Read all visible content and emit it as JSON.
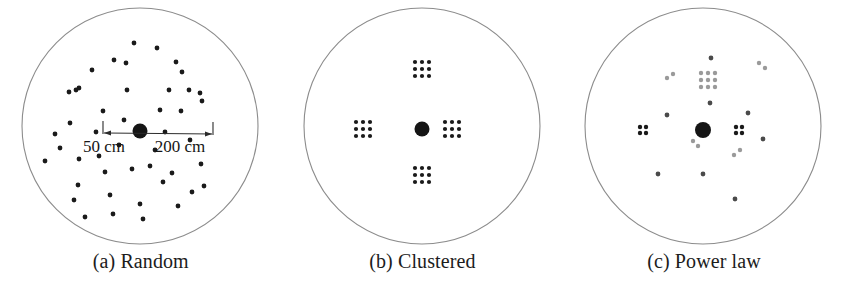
{
  "figure": {
    "type": "spatial-point-distribution-diagram",
    "panel_count": 3,
    "background_color": "#ffffff",
    "boundary_circle_color": "#8c8c8c",
    "dot_color": "#1a1a1a",
    "faint_dot_color": "#9a9a9a"
  },
  "annotation": {
    "inner_label": "50 cm",
    "outer_label": "200 cm",
    "line_color": "#2b2b2b",
    "font_size_px": 17
  },
  "panels": [
    {
      "id": "a",
      "caption": "(a) Random",
      "boundary": {
        "cx": 140,
        "cy": 126,
        "r": 118
      },
      "hub": {
        "cx": 140,
        "cy": 131,
        "r": 7.5
      },
      "has_scale_annotation": true,
      "point_count": 46,
      "points": [
        [
          134,
          43
        ],
        [
          157,
          48
        ],
        [
          114,
          60
        ],
        [
          126,
          63
        ],
        [
          92,
          70
        ],
        [
          176,
          62
        ],
        [
          182,
          72
        ],
        [
          76,
          90
        ],
        [
          79,
          88
        ],
        [
          69,
          92
        ],
        [
          127,
          90
        ],
        [
          169,
          90
        ],
        [
          189,
          90
        ],
        [
          200,
          93
        ],
        [
          202,
          101
        ],
        [
          103,
          111
        ],
        [
          160,
          110
        ],
        [
          181,
          111
        ],
        [
          70,
          123
        ],
        [
          55,
          134
        ],
        [
          99,
          156
        ],
        [
          79,
          159
        ],
        [
          45,
          161
        ],
        [
          78,
          185
        ],
        [
          105,
          172
        ],
        [
          132,
          169
        ],
        [
          150,
          166
        ],
        [
          172,
          173
        ],
        [
          201,
          164
        ],
        [
          163,
          182
        ],
        [
          204,
          186
        ],
        [
          74,
          200
        ],
        [
          110,
          195
        ],
        [
          140,
          204
        ],
        [
          192,
          192
        ],
        [
          113,
          214
        ],
        [
          178,
          206
        ],
        [
          143,
          219
        ],
        [
          85,
          217
        ],
        [
          155,
          150
        ],
        [
          119,
          145
        ],
        [
          190,
          140
        ],
        [
          60,
          148
        ],
        [
          165,
          132
        ],
        [
          96,
          132
        ],
        [
          124,
          120
        ]
      ]
    },
    {
      "id": "b",
      "caption": "(b) Clustered",
      "boundary": {
        "cx": 140,
        "cy": 126,
        "r": 118
      },
      "hub": {
        "cx": 140,
        "cy": 129,
        "r": 7.5
      },
      "has_scale_annotation": false,
      "cluster_layout": "3x3-grid",
      "cluster_dot_count": 9,
      "cluster_spacing_px": 7,
      "cluster_dot_radius_px": 2.1,
      "clusters": [
        {
          "cx": 140,
          "cy": 69,
          "position": "top"
        },
        {
          "cx": 81,
          "cy": 129,
          "position": "left"
        },
        {
          "cx": 170,
          "cy": 129,
          "position": "right"
        },
        {
          "cx": 140,
          "cy": 175,
          "position": "bottom"
        }
      ]
    },
    {
      "id": "c",
      "caption": "(c) Power law",
      "boundary": {
        "cx": 140,
        "cy": 126,
        "r": 118
      },
      "hub": {
        "cx": 140,
        "cy": 130,
        "r": 8
      },
      "has_scale_annotation": false,
      "clusters_dark": [
        {
          "cx": 80,
          "cy": 130,
          "layout": "2x2",
          "count": 4,
          "spacing": 6,
          "r": 2.2
        },
        {
          "cx": 176,
          "cy": 130,
          "layout": "2x2",
          "count": 4,
          "spacing": 6,
          "r": 2.2
        }
      ],
      "clusters_faint": [
        {
          "cx": 145,
          "cy": 80,
          "layout": "3x3",
          "count": 9,
          "spacing": 7,
          "r": 2.2
        }
      ],
      "faint_pairs": [
        [
          104,
          78
        ],
        [
          110,
          74
        ],
        [
          196,
          63
        ],
        [
          202,
          68
        ],
        [
          130,
          141
        ],
        [
          135,
          146
        ],
        [
          171,
          155
        ],
        [
          177,
          150
        ]
      ],
      "singles_dark": [
        [
          148,
          58
        ],
        [
          147,
          103
        ],
        [
          104,
          115
        ],
        [
          185,
          113
        ],
        [
          200,
          139
        ],
        [
          95,
          174
        ],
        [
          140,
          174
        ],
        [
          172,
          199
        ]
      ]
    }
  ]
}
